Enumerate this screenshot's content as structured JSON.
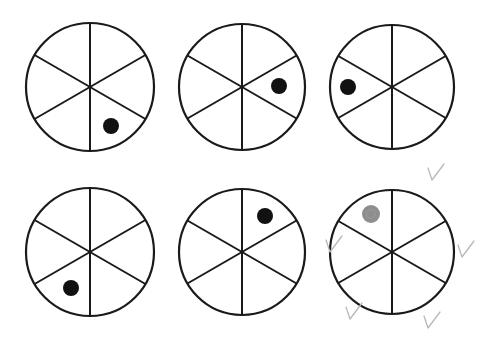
{
  "worksheet": {
    "stroke_color": "#1a1a1a",
    "dot_color": "#111111",
    "pencil_dot_color": "#7a7a7a",
    "check_color": "#b8b8b8",
    "spinners": [
      {
        "id": 1,
        "cx": 90,
        "cy": 87,
        "r": 64,
        "dot": {
          "x": 111,
          "y": 126,
          "r": 8,
          "style": "ink"
        }
      },
      {
        "id": 2,
        "cx": 242,
        "cy": 87,
        "r": 63,
        "dot": {
          "x": 279,
          "y": 86,
          "r": 8,
          "style": "ink"
        }
      },
      {
        "id": 3,
        "cx": 392,
        "cy": 87,
        "r": 62,
        "dot": {
          "x": 348,
          "y": 87,
          "r": 8,
          "style": "ink"
        }
      },
      {
        "id": 4,
        "cx": 90,
        "cy": 252,
        "r": 64,
        "dot": {
          "x": 71,
          "y": 288,
          "r": 8,
          "style": "ink"
        }
      },
      {
        "id": 5,
        "cx": 242,
        "cy": 252,
        "r": 63,
        "dot": {
          "x": 265,
          "y": 216,
          "r": 8,
          "style": "ink"
        }
      },
      {
        "id": 6,
        "cx": 392,
        "cy": 252,
        "r": 62,
        "dot": {
          "x": 371,
          "y": 214,
          "r": 9,
          "style": "pencil"
        }
      }
    ],
    "check_marks": [
      {
        "x": 428,
        "y": 168
      },
      {
        "x": 326,
        "y": 240
      },
      {
        "x": 458,
        "y": 245
      },
      {
        "x": 346,
        "y": 307
      },
      {
        "x": 424,
        "y": 316
      }
    ]
  }
}
